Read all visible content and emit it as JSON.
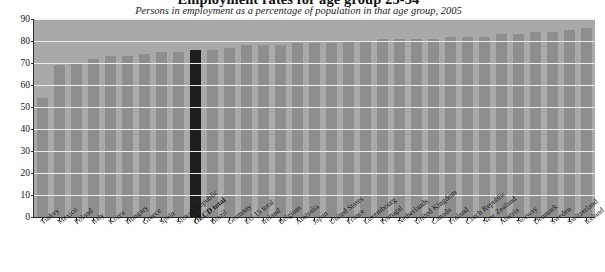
{
  "chart_data": {
    "type": "bar",
    "title": "Employment rates for age group 25-54",
    "subtitle": "Persons in employment as a percentage of population in that age group, 2005",
    "xlabel": "",
    "ylabel": "",
    "ylim": [
      0,
      90
    ],
    "ytick_step": 10,
    "yticks": [
      "0",
      "10",
      "20",
      "30",
      "40",
      "50",
      "60",
      "70",
      "80",
      "90"
    ],
    "grid": true,
    "legend": "none",
    "highlight_category": "OECD total",
    "colors": {
      "bar": "#8e8e8e",
      "highlight_bar": "#1e1e1e",
      "plot_background": "#a9a9a9",
      "gridline": "#ededed",
      "axis": "#2b2b2b"
    },
    "categories": [
      "Turkey",
      "Mexico",
      "Poland",
      "Italy",
      "Korea",
      "Hungary",
      "Greece",
      "Spain",
      "Slovak Republic",
      "OECD total",
      "Brazil",
      "Germany",
      "EU 15 total",
      "Ireland",
      "Belgium",
      "Australia",
      "Japan",
      "United States",
      "France",
      "Luxembourg",
      "Portugal",
      "Netherlands",
      "United Kingdom",
      "Canada",
      "Finland",
      "Czech Republic",
      "New Zealand",
      "Austria",
      "Norway",
      "Denmark",
      "Sweden",
      "Switzerland",
      "Iceland"
    ],
    "values": [
      54,
      69,
      70,
      72,
      73,
      73,
      74,
      75,
      75,
      76,
      76,
      77,
      78,
      78,
      78,
      79,
      79,
      79,
      80,
      80,
      81,
      81,
      81,
      81,
      82,
      82,
      82,
      83,
      83,
      84,
      84,
      85,
      86
    ]
  }
}
